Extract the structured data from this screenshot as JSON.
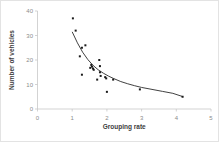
{
  "chart_data": {
    "type": "scatter",
    "title": "",
    "xlabel": "Grouping rate",
    "ylabel": "Number of vehicles",
    "xlim": [
      0,
      5
    ],
    "ylim": [
      0,
      40
    ],
    "xticks": [
      0,
      1,
      2,
      3,
      4,
      5
    ],
    "yticks": [
      0,
      10,
      20,
      30,
      40
    ],
    "xtick_labels": [
      "0",
      "1",
      "2",
      "3",
      "4",
      "5"
    ],
    "ytick_labels": [
      "0",
      "10",
      "20",
      "30",
      "40"
    ],
    "grid": false,
    "legend": false,
    "marker_color": "#1a1a1a",
    "curve_color": "#2b2b2b",
    "axis_color": "#c8c8c8",
    "points": [
      {
        "x": 1.02,
        "y": 37.0
      },
      {
        "x": 1.1,
        "y": 32.0
      },
      {
        "x": 1.28,
        "y": 25.0
      },
      {
        "x": 1.38,
        "y": 26.0
      },
      {
        "x": 1.22,
        "y": 21.5
      },
      {
        "x": 1.28,
        "y": 14.0
      },
      {
        "x": 1.55,
        "y": 18.0
      },
      {
        "x": 1.57,
        "y": 17.3
      },
      {
        "x": 1.6,
        "y": 16.5
      },
      {
        "x": 1.62,
        "y": 16.0
      },
      {
        "x": 1.52,
        "y": 16.8
      },
      {
        "x": 1.78,
        "y": 20.0
      },
      {
        "x": 1.8,
        "y": 17.5
      },
      {
        "x": 1.8,
        "y": 15.0
      },
      {
        "x": 1.82,
        "y": 13.5
      },
      {
        "x": 1.72,
        "y": 12.0
      },
      {
        "x": 1.95,
        "y": 13.0
      },
      {
        "x": 1.98,
        "y": 12.5
      },
      {
        "x": 2.0,
        "y": 7.0
      },
      {
        "x": 2.18,
        "y": 12.0
      },
      {
        "x": 2.95,
        "y": 8.0
      },
      {
        "x": 4.18,
        "y": 5.0
      }
    ],
    "trend_curve": {
      "description": "fitted decreasing power-law trend line",
      "points": [
        {
          "x": 1.0,
          "y": 31.5
        },
        {
          "x": 1.15,
          "y": 27.0
        },
        {
          "x": 1.3,
          "y": 23.2
        },
        {
          "x": 1.45,
          "y": 20.2
        },
        {
          "x": 1.6,
          "y": 17.8
        },
        {
          "x": 1.75,
          "y": 16.0
        },
        {
          "x": 1.9,
          "y": 14.6
        },
        {
          "x": 2.05,
          "y": 13.4
        },
        {
          "x": 2.2,
          "y": 12.4
        },
        {
          "x": 2.4,
          "y": 11.2
        },
        {
          "x": 2.6,
          "y": 10.3
        },
        {
          "x": 2.8,
          "y": 9.5
        },
        {
          "x": 3.0,
          "y": 8.8
        },
        {
          "x": 3.3,
          "y": 8.0
        },
        {
          "x": 3.6,
          "y": 7.2
        },
        {
          "x": 3.9,
          "y": 6.4
        },
        {
          "x": 4.2,
          "y": 5.0
        }
      ]
    }
  }
}
